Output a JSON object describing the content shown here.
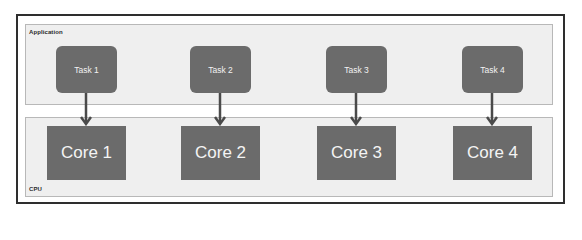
{
  "diagram": {
    "application_layer": {
      "label": "Application",
      "tasks": [
        {
          "label": "Task 1"
        },
        {
          "label": "Task 2"
        },
        {
          "label": "Task 3"
        },
        {
          "label": "Task 4"
        }
      ]
    },
    "cpu_layer": {
      "label": "CPU",
      "cores": [
        {
          "label": "Core 1"
        },
        {
          "label": "Core 2"
        },
        {
          "label": "Core 3"
        },
        {
          "label": "Core 4"
        }
      ]
    },
    "edges": [
      {
        "from": "Task 1",
        "to": "Core 1"
      },
      {
        "from": "Task 2",
        "to": "Core 2"
      },
      {
        "from": "Task 3",
        "to": "Core 3"
      },
      {
        "from": "Task 4",
        "to": "Core 4"
      }
    ],
    "colors": {
      "node_fill": "#6b6b6b",
      "layer_fill": "#efefef",
      "arrow": "#4a4a4a",
      "frame_border": "#2e2e2e"
    }
  }
}
